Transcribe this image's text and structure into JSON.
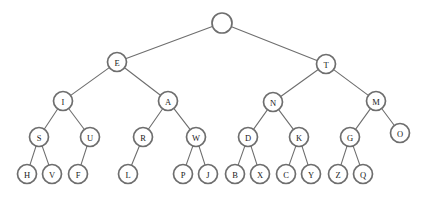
{
  "figure": {
    "background_color": "#ffffff",
    "node_fill": "#ffffff",
    "node_stroke": "#6e6e6e",
    "edge_stroke": "#6e6e6e",
    "label_color": "#1a1a1a",
    "node_radius": 9.5,
    "root_radius": 10
  },
  "chart_data": {
    "type": "diagram",
    "subtype": "tree",
    "node_count": 31,
    "depth": 5,
    "nodes": [
      {
        "id": "root",
        "label": "",
        "x": 222,
        "y": 23,
        "r": 10,
        "level": 1
      },
      {
        "id": "E",
        "label": "E",
        "x": 117,
        "y": 62,
        "r": 9.5,
        "level": 2
      },
      {
        "id": "T",
        "label": "T",
        "x": 326,
        "y": 64,
        "r": 9.5,
        "level": 2
      },
      {
        "id": "I",
        "label": "I",
        "x": 63,
        "y": 101,
        "r": 9.5,
        "level": 3
      },
      {
        "id": "A",
        "label": "A",
        "x": 168,
        "y": 101,
        "r": 9.5,
        "level": 3
      },
      {
        "id": "N",
        "label": "N",
        "x": 273,
        "y": 102,
        "r": 9.5,
        "level": 3
      },
      {
        "id": "M",
        "label": "M",
        "x": 376,
        "y": 101,
        "r": 9.5,
        "level": 3
      },
      {
        "id": "S",
        "label": "S",
        "x": 39,
        "y": 137,
        "r": 9.5,
        "level": 4
      },
      {
        "id": "U",
        "label": "U",
        "x": 90,
        "y": 137,
        "r": 9.5,
        "level": 4
      },
      {
        "id": "R",
        "label": "R",
        "x": 143,
        "y": 137,
        "r": 9.5,
        "level": 4
      },
      {
        "id": "W",
        "label": "W",
        "x": 196,
        "y": 137,
        "r": 9.5,
        "level": 4
      },
      {
        "id": "D",
        "label": "D",
        "x": 248,
        "y": 137,
        "r": 9.5,
        "level": 4
      },
      {
        "id": "K",
        "label": "K",
        "x": 299,
        "y": 137,
        "r": 9.5,
        "level": 4
      },
      {
        "id": "G",
        "label": "G",
        "x": 350,
        "y": 137,
        "r": 9.5,
        "level": 4
      },
      {
        "id": "O",
        "label": "O",
        "x": 400,
        "y": 133,
        "r": 9.5,
        "level": 4
      },
      {
        "id": "H",
        "label": "H",
        "x": 27,
        "y": 174,
        "r": 9.5,
        "level": 5
      },
      {
        "id": "V",
        "label": "V",
        "x": 52,
        "y": 174,
        "r": 9.5,
        "level": 5
      },
      {
        "id": "F",
        "label": "F",
        "x": 78,
        "y": 174,
        "r": 9.5,
        "level": 5
      },
      {
        "id": "L",
        "label": "L",
        "x": 128,
        "y": 174,
        "r": 9.5,
        "level": 5
      },
      {
        "id": "P",
        "label": "P",
        "x": 183,
        "y": 174,
        "r": 9.5,
        "level": 5
      },
      {
        "id": "J",
        "label": "J",
        "x": 208,
        "y": 174,
        "r": 9.5,
        "level": 5
      },
      {
        "id": "B",
        "label": "B",
        "x": 235,
        "y": 174,
        "r": 9.5,
        "level": 5
      },
      {
        "id": "X",
        "label": "X",
        "x": 260,
        "y": 174,
        "r": 9.5,
        "level": 5
      },
      {
        "id": "C",
        "label": "C",
        "x": 286,
        "y": 174,
        "r": 9.5,
        "level": 5
      },
      {
        "id": "Y",
        "label": "Y",
        "x": 311,
        "y": 174,
        "r": 9.5,
        "level": 5
      },
      {
        "id": "Z",
        "label": "Z",
        "x": 338,
        "y": 174,
        "r": 9.5,
        "level": 5
      },
      {
        "id": "Q",
        "label": "Q",
        "x": 363,
        "y": 174,
        "r": 9.5,
        "level": 5
      }
    ],
    "edges": [
      {
        "from": "root",
        "to": "E"
      },
      {
        "from": "root",
        "to": "T"
      },
      {
        "from": "E",
        "to": "I"
      },
      {
        "from": "E",
        "to": "A"
      },
      {
        "from": "T",
        "to": "N"
      },
      {
        "from": "T",
        "to": "M"
      },
      {
        "from": "I",
        "to": "S"
      },
      {
        "from": "I",
        "to": "U"
      },
      {
        "from": "A",
        "to": "R"
      },
      {
        "from": "A",
        "to": "W"
      },
      {
        "from": "N",
        "to": "D"
      },
      {
        "from": "N",
        "to": "K"
      },
      {
        "from": "M",
        "to": "G"
      },
      {
        "from": "M",
        "to": "O"
      },
      {
        "from": "S",
        "to": "H"
      },
      {
        "from": "S",
        "to": "V"
      },
      {
        "from": "U",
        "to": "F"
      },
      {
        "from": "R",
        "to": "L"
      },
      {
        "from": "W",
        "to": "P"
      },
      {
        "from": "W",
        "to": "J"
      },
      {
        "from": "D",
        "to": "B"
      },
      {
        "from": "D",
        "to": "X"
      },
      {
        "from": "K",
        "to": "C"
      },
      {
        "from": "K",
        "to": "Y"
      },
      {
        "from": "G",
        "to": "Z"
      },
      {
        "from": "G",
        "to": "Q"
      }
    ]
  }
}
